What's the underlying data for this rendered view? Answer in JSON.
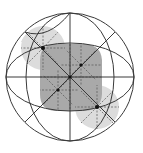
{
  "diagram": {
    "colors": {
      "background": "#ffffff",
      "outline": "#3a3a3a",
      "dark_region": "#a9a9a9",
      "light_region": "#dcdcdc",
      "dashed": "#555555",
      "point": "#111111"
    },
    "circle": {
      "cx": 70,
      "cy": 77,
      "r": 64
    },
    "regions": {
      "dark": "central rounded square",
      "light": [
        "upper-left disc",
        "lower-right disc"
      ]
    },
    "points": [
      {
        "label": "upper-left",
        "x": 43,
        "y": 48
      },
      {
        "label": "inner-upper-right",
        "x": 81,
        "y": 65
      },
      {
        "label": "center",
        "x": 70,
        "y": 77
      },
      {
        "label": "inner-lower-left",
        "x": 58,
        "y": 90
      },
      {
        "label": "lower-right",
        "x": 97,
        "y": 107
      }
    ]
  }
}
